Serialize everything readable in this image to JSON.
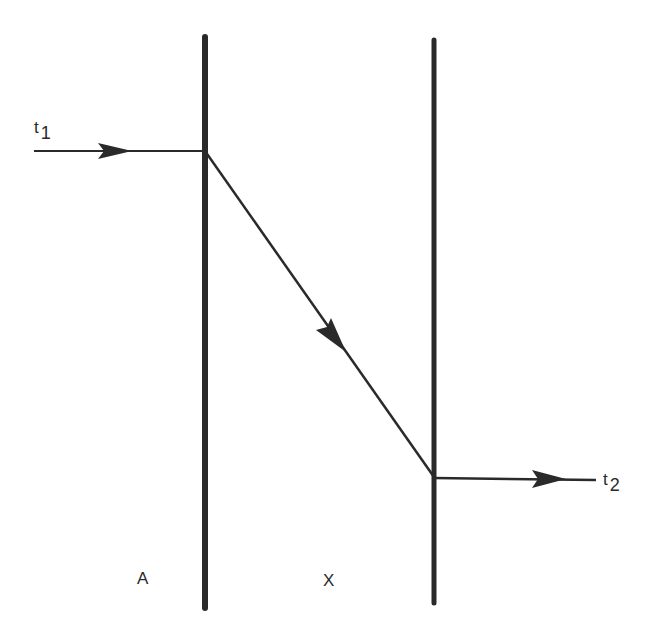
{
  "diagram": {
    "type": "ray-path",
    "colors": {
      "line": "#2a2a2a",
      "background": "#ffffff"
    },
    "boundaries": [
      {
        "name": "boundary-left",
        "x": 205,
        "y_top": 37,
        "y_bottom": 608
      },
      {
        "name": "boundary-right",
        "x": 434,
        "y_top": 40,
        "y_bottom": 603
      }
    ],
    "path": {
      "incoming": {
        "from": [
          34,
          151
        ],
        "to": [
          205,
          151
        ],
        "arrow_at": [
          130,
          151
        ]
      },
      "crossing": {
        "from": [
          205,
          151
        ],
        "to": [
          434,
          477
        ],
        "arrow_at": [
          345,
          350
        ]
      },
      "outgoing": {
        "from": [
          434,
          477
        ],
        "to": [
          595,
          479
        ],
        "arrow_at": [
          562,
          479
        ]
      }
    },
    "labels": {
      "t1": {
        "base": "t",
        "sub": "1"
      },
      "t2": {
        "base": "t",
        "sub": "2"
      },
      "region_a": "A",
      "region_x": "X"
    }
  }
}
